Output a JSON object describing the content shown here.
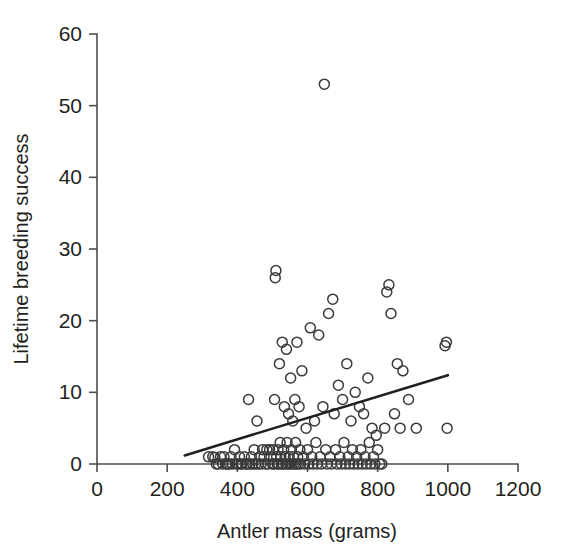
{
  "figure": {
    "name": "antler-mass-vs-lifetime-breeding-success-scatter",
    "background_color": "#ffffff",
    "ink_color": "#231f20"
  },
  "chart_data": {
    "type": "scatter",
    "title": "",
    "xlabel": "Antler mass (grams)",
    "ylabel": "Lifetime breeding success",
    "xlim": [
      0,
      1200
    ],
    "ylim": [
      0,
      60
    ],
    "xticks": [
      0,
      200,
      400,
      600,
      800,
      1000,
      1200
    ],
    "yticks": [
      0,
      10,
      20,
      30,
      40,
      50,
      60
    ],
    "xticklabels": [
      "0",
      "200",
      "400",
      "600",
      "800",
      "1000",
      "1200"
    ],
    "yticklabels": [
      "0",
      "10",
      "20",
      "30",
      "40",
      "50",
      "60"
    ],
    "grid": false,
    "legend": null,
    "marker": {
      "style": "open-circle",
      "radius_px": 5,
      "edge_color": "#3a3a3a",
      "fill": "none",
      "stroke_width": 1.5
    },
    "series": [
      {
        "name": "red deer stags",
        "points": [
          [
            318,
            1.0
          ],
          [
            330,
            1.0
          ],
          [
            336,
            0.9
          ],
          [
            340,
            0.0
          ],
          [
            346,
            0.0
          ],
          [
            352,
            1.0
          ],
          [
            358,
            0.0
          ],
          [
            362,
            1.0
          ],
          [
            368,
            0.0
          ],
          [
            372,
            0.0
          ],
          [
            378,
            0.0
          ],
          [
            382,
            1.0
          ],
          [
            386,
            0.0
          ],
          [
            392,
            2.0
          ],
          [
            398,
            0.0
          ],
          [
            402,
            0.0
          ],
          [
            406,
            1.0
          ],
          [
            410,
            0.0
          ],
          [
            414,
            0.0
          ],
          [
            420,
            1.0
          ],
          [
            424,
            0.0
          ],
          [
            428,
            0.0
          ],
          [
            432,
            9.0
          ],
          [
            436,
            0.0
          ],
          [
            440,
            1.0
          ],
          [
            444,
            0.0
          ],
          [
            448,
            2.0
          ],
          [
            452,
            0.0
          ],
          [
            456,
            6.0
          ],
          [
            460,
            0.0
          ],
          [
            464,
            1.0
          ],
          [
            468,
            0.0
          ],
          [
            472,
            2.0
          ],
          [
            476,
            1.0
          ],
          [
            480,
            0.0
          ],
          [
            484,
            2.0
          ],
          [
            488,
            0.0
          ],
          [
            492,
            2.0
          ],
          [
            496,
            1.0
          ],
          [
            500,
            0.0
          ],
          [
            502,
            2.0
          ],
          [
            504,
            0.0
          ],
          [
            506,
            9.0
          ],
          [
            508,
            26.0
          ],
          [
            510,
            27.0
          ],
          [
            512,
            1.0
          ],
          [
            514,
            0.0
          ],
          [
            516,
            2.0
          ],
          [
            518,
            0.0
          ],
          [
            520,
            14.0
          ],
          [
            522,
            3.0
          ],
          [
            524,
            1.0
          ],
          [
            526,
            0.0
          ],
          [
            528,
            17.0
          ],
          [
            530,
            0.0
          ],
          [
            532,
            2.0
          ],
          [
            534,
            8.0
          ],
          [
            536,
            1.0
          ],
          [
            538,
            0.0
          ],
          [
            540,
            16.0
          ],
          [
            542,
            3.0
          ],
          [
            544,
            0.0
          ],
          [
            546,
            7.0
          ],
          [
            548,
            1.0
          ],
          [
            550,
            0.0
          ],
          [
            552,
            12.0
          ],
          [
            554,
            2.0
          ],
          [
            556,
            0.0
          ],
          [
            558,
            6.0
          ],
          [
            560,
            1.0
          ],
          [
            562,
            0.0
          ],
          [
            564,
            9.0
          ],
          [
            566,
            3.0
          ],
          [
            568,
            0.0
          ],
          [
            570,
            17.0
          ],
          [
            572,
            1.0
          ],
          [
            574,
            0.0
          ],
          [
            576,
            8.0
          ],
          [
            578,
            2.0
          ],
          [
            580,
            0.0
          ],
          [
            584,
            13.0
          ],
          [
            588,
            1.0
          ],
          [
            592,
            0.0
          ],
          [
            596,
            5.0
          ],
          [
            600,
            2.0
          ],
          [
            604,
            0.0
          ],
          [
            608,
            19.0
          ],
          [
            612,
            1.0
          ],
          [
            616,
            0.0
          ],
          [
            620,
            6.0
          ],
          [
            624,
            3.0
          ],
          [
            628,
            0.0
          ],
          [
            632,
            18.0
          ],
          [
            636,
            1.0
          ],
          [
            640,
            0.0
          ],
          [
            644,
            8.0
          ],
          [
            648,
            53.0
          ],
          [
            652,
            2.0
          ],
          [
            656,
            0.0
          ],
          [
            660,
            21.0
          ],
          [
            664,
            1.0
          ],
          [
            668,
            0.0
          ],
          [
            672,
            23.0
          ],
          [
            676,
            7.0
          ],
          [
            680,
            2.0
          ],
          [
            684,
            0.0
          ],
          [
            688,
            11.0
          ],
          [
            692,
            1.0
          ],
          [
            696,
            0.0
          ],
          [
            700,
            9.0
          ],
          [
            704,
            3.0
          ],
          [
            708,
            0.0
          ],
          [
            712,
            14.0
          ],
          [
            716,
            1.0
          ],
          [
            720,
            0.0
          ],
          [
            724,
            6.0
          ],
          [
            728,
            2.0
          ],
          [
            732,
            0.0
          ],
          [
            736,
            10.0
          ],
          [
            740,
            1.0
          ],
          [
            744,
            0.0
          ],
          [
            748,
            8.0
          ],
          [
            752,
            2.0
          ],
          [
            756,
            0.0
          ],
          [
            760,
            7.0
          ],
          [
            764,
            1.0
          ],
          [
            768,
            0.0
          ],
          [
            772,
            12.0
          ],
          [
            776,
            3.0
          ],
          [
            780,
            0.0
          ],
          [
            784,
            5.0
          ],
          [
            788,
            1.0
          ],
          [
            792,
            0.0
          ],
          [
            796,
            4.0
          ],
          [
            800,
            2.0
          ],
          [
            806,
            0.0
          ],
          [
            812,
            0.0
          ],
          [
            820,
            5.0
          ],
          [
            826,
            24.0
          ],
          [
            832,
            25.0
          ],
          [
            838,
            21.0
          ],
          [
            848,
            7.0
          ],
          [
            856,
            14.0
          ],
          [
            864,
            5.0
          ],
          [
            872,
            13.0
          ],
          [
            888,
            9.0
          ],
          [
            910,
            5.0
          ],
          [
            992,
            16.5
          ],
          [
            996,
            17.0
          ],
          [
            998,
            5.0
          ]
        ]
      }
    ],
    "fit_line": {
      "name": "linear regression fit",
      "x": [
        250,
        1000
      ],
      "y": [
        1.2,
        12.4
      ],
      "color": "#231f20",
      "width_px": 2.6
    }
  }
}
